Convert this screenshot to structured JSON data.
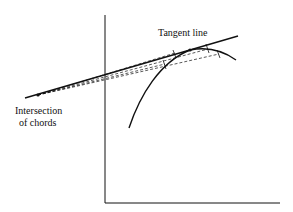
{
  "labels": {
    "tangent": "Tangent line",
    "intersection_line1": "Intersection",
    "intersection_line2": "of chords"
  },
  "colors": {
    "ink": "#111111",
    "background": "#ffffff"
  }
}
